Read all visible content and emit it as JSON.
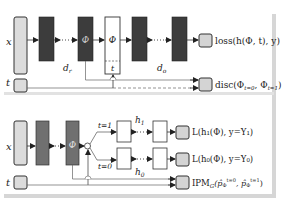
{
  "colors": {
    "input_fill": "#dcdcdc",
    "dark_fill": "#3c3c3c",
    "mid_fill": "#707070",
    "output_fill": "#d4d4d4",
    "stroke": "#333333",
    "line": "#555555",
    "border_bar": "#d6d6d6"
  },
  "top_panel": {
    "input_x_label": "x",
    "input_t_label": "t",
    "phi_label": "Φ",
    "concat_phi_label": "Φ",
    "concat_t_label": "t",
    "dr_label": "d",
    "dr_sub": "r",
    "do_label": "d",
    "do_sub": "o",
    "loss_label": "loss(h(Φ, t), y)",
    "disc_label": "disc(Φ",
    "disc_sub1": "t=0",
    "disc_mid": ", Φ",
    "disc_sub2": "t=1",
    "disc_end": ")"
  },
  "bottom_panel": {
    "input_x_label": "x",
    "input_t_label": "t",
    "phi_label": "Φ",
    "branch_t1_label": "t=1",
    "branch_t0_label": "t=0",
    "h1_label": "h",
    "h1_sub": "1",
    "h0_label": "h",
    "h0_sub": "0",
    "loss1_label": "L(h₁(Φ), y=Y₁)",
    "loss0_label": "L(h₀(Φ), y=Y₀)",
    "ipm_label": "IPM",
    "ipm_sub": "G",
    "ipm_args": "(p̂Φ^t=0, p̂Φ^t=1)"
  }
}
